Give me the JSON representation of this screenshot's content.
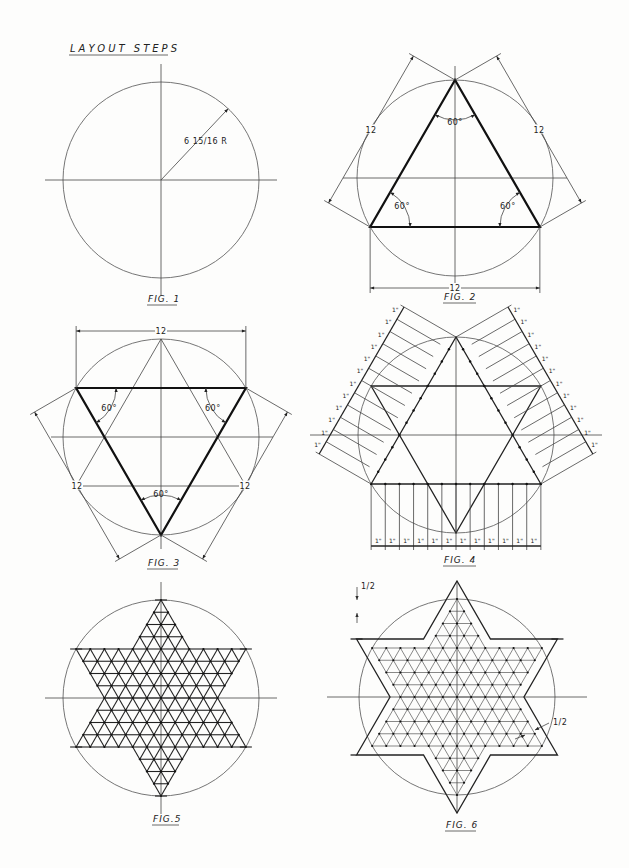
{
  "sheet": {
    "title": "LAYOUT STEPS",
    "ink_color": "#222222",
    "paper_color": "#fdfdfc"
  },
  "figures": [
    {
      "id": "fig1",
      "caption": "FIG. 1",
      "center": [
        161,
        180
      ],
      "radius": 98,
      "annotation": "6 15/16 R"
    },
    {
      "id": "fig2",
      "caption": "FIG. 2",
      "center": [
        455,
        178
      ],
      "radius": 98,
      "side_label": "12",
      "angle_label": "60°",
      "dimensions": [
        "12",
        "12",
        "12"
      ],
      "angles": [
        "60°",
        "60°",
        "60°"
      ]
    },
    {
      "id": "fig3",
      "caption": "FIG. 3",
      "center": [
        161,
        437
      ],
      "radius": 98,
      "side_label": "12",
      "angle_label": "60°",
      "dimensions": [
        "12",
        "12",
        "12"
      ],
      "angles": [
        "60°",
        "60°",
        "60°"
      ]
    },
    {
      "id": "fig4",
      "caption": "FIG. 4",
      "center": [
        456,
        435
      ],
      "radius": 98,
      "division_label": "1\"",
      "divisions": 12
    },
    {
      "id": "fig5",
      "caption": "FIG.5",
      "center": [
        161,
        698
      ],
      "radius": 98,
      "grid_divisions": 12
    },
    {
      "id": "fig6",
      "caption": "FIG. 6",
      "center": [
        457,
        697
      ],
      "radius": 98,
      "grid_divisions": 12,
      "offset_labels": [
        "1/2",
        "1/2"
      ]
    }
  ]
}
